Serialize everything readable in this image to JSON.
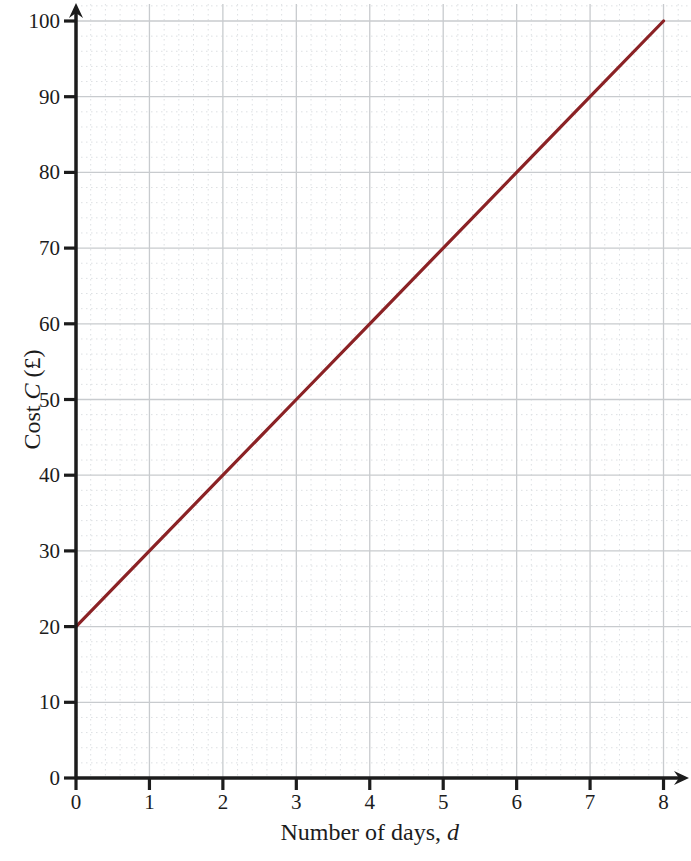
{
  "figure": {
    "x_axis_title": {
      "regular": "Number of days, ",
      "italic": "d"
    },
    "y_axis_title": {
      "regular": "Cost ",
      "italic": "C",
      "suffix": " (£)"
    },
    "x_tick_labels": [
      "0",
      "1",
      "2",
      "3",
      "4",
      "5",
      "6",
      "7",
      "8"
    ],
    "y_tick_labels": [
      "0",
      "10",
      "20",
      "30",
      "40",
      "50",
      "60",
      "70",
      "80",
      "90",
      "100"
    ],
    "colors": {
      "line": "#8b2225",
      "axis": "#1c1c1c",
      "major_grid": "#c8cbce",
      "minor_grid": "#dde0e3",
      "label": "#1c1c1c",
      "background": "#ffffff"
    }
  },
  "chart_data": {
    "type": "line",
    "x": [
      0,
      1,
      2,
      3,
      4,
      5,
      6,
      7,
      8
    ],
    "series": [
      {
        "name": "Cost",
        "values": [
          20,
          30,
          40,
          50,
          60,
          70,
          80,
          90,
          100
        ]
      }
    ],
    "title": "",
    "xlabel": "Number of days, d",
    "ylabel": "Cost C (£)",
    "xlim": [
      0,
      8
    ],
    "ylim": [
      0,
      100
    ],
    "x_tick_step": 1,
    "y_tick_step": 10,
    "minor_x_per_major": 5,
    "minor_y_per_major": 5,
    "grid": "major solid + minor dotted, extends past axes to top and right edges",
    "legend": "none",
    "line_color": "#8b2225",
    "annotations": []
  }
}
